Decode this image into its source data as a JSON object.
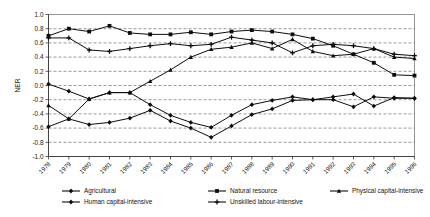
{
  "chart_data": {
    "type": "line",
    "title": "",
    "xlabel": "",
    "ylabel": "NER",
    "ylim": [
      -1.0,
      1.0
    ],
    "ytick_step": 0.2,
    "grid": true,
    "legend_position": "bottom",
    "categories": [
      "1978",
      "1979",
      "1980",
      "1981",
      "1982",
      "1983",
      "1984",
      "1985",
      "1986",
      "1987",
      "1988",
      "1989",
      "1990",
      "1991",
      "1992",
      "1993",
      "1994",
      "1995",
      "1996"
    ],
    "yticks": [
      "1.0",
      "0.8",
      "0.6",
      "0.4",
      "0.2",
      "0.0",
      "-0.2",
      "-0.4",
      "-0.6",
      "-0.8",
      "-1.0"
    ],
    "series": [
      {
        "name": "Agricultural",
        "marker": "diamond",
        "values": [
          0.02,
          -0.08,
          -0.19,
          -0.1,
          -0.1,
          -0.27,
          -0.42,
          -0.52,
          -0.59,
          -0.42,
          -0.27,
          -0.21,
          -0.16,
          -0.2,
          -0.16,
          -0.12,
          -0.29,
          -0.17,
          -0.18
        ]
      },
      {
        "name": "Natural resource",
        "marker": "square",
        "values": [
          0.7,
          0.8,
          0.76,
          0.84,
          0.74,
          0.72,
          0.72,
          0.75,
          0.72,
          0.76,
          0.78,
          0.76,
          0.72,
          0.66,
          0.56,
          0.44,
          0.32,
          0.15,
          0.14
        ]
      },
      {
        "name": "Physical capital-intensive",
        "marker": "triangle",
        "values": [
          -0.28,
          -0.47,
          -0.19,
          -0.1,
          -0.1,
          0.06,
          0.22,
          0.4,
          0.51,
          0.54,
          0.6,
          0.52,
          0.65,
          0.48,
          0.42,
          0.44,
          0.52,
          0.4,
          0.38
        ]
      },
      {
        "name": "Human capital-intensive",
        "marker": "diamond",
        "values": [
          -0.58,
          -0.47,
          -0.55,
          -0.52,
          -0.46,
          -0.35,
          -0.5,
          -0.6,
          -0.73,
          -0.57,
          -0.41,
          -0.33,
          -0.21,
          -0.2,
          -0.2,
          -0.3,
          -0.16,
          -0.18,
          -0.18
        ]
      },
      {
        "name": "Unskilled labour-intensive",
        "marker": "cross",
        "values": [
          0.67,
          0.67,
          0.5,
          0.48,
          0.52,
          0.56,
          0.59,
          0.56,
          0.58,
          0.68,
          0.64,
          0.6,
          0.46,
          0.56,
          0.58,
          0.56,
          0.52,
          0.44,
          0.42
        ]
      }
    ]
  }
}
